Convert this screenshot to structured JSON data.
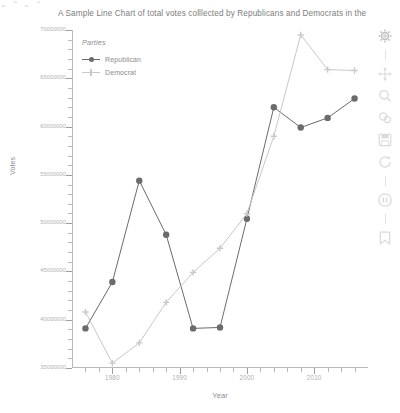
{
  "top_strip": "⌄  ⌃           ⌄  ⌃",
  "chart": {
    "title": "A Sample Line Chart of total votes colllected by Republicans and Democrats in the",
    "xlabel": "Year",
    "ylabel": "Votes",
    "legend_title": "Parties"
  },
  "legend": {
    "entries": [
      {
        "label": "Republican",
        "marker": "circle-marker",
        "color": "#6b6b6b"
      },
      {
        "label": "Democrat",
        "marker": "plus-marker",
        "color": "#c8c8c8"
      }
    ]
  },
  "toolbar": {
    "items": [
      {
        "name": "settings-gear-icon",
        "label": "Settings"
      },
      {
        "name": "move-pan-icon",
        "label": "Pan"
      },
      {
        "name": "zoom-search-icon",
        "label": "Zoom"
      },
      {
        "name": "zoom-region-icon",
        "label": "Zoom region"
      },
      {
        "name": "save-disk-icon",
        "label": "Save"
      },
      {
        "name": "refresh-reset-icon",
        "label": "Reset"
      },
      {
        "name": "info-circle-icon",
        "label": "Info"
      },
      {
        "name": "help-bookmark-icon",
        "label": "Help"
      }
    ]
  },
  "chart_data": {
    "type": "line",
    "title": "A Sample Line Chart of total votes colllected by Republicans and Democrats in the",
    "xlabel": "Year",
    "ylabel": "Votes",
    "legend_title": "Parties",
    "legend_position": "top-left inside plot",
    "grid": false,
    "xlim": [
      1974,
      2018
    ],
    "ylim": [
      35000000,
      70000000
    ],
    "xticks": [
      1980,
      1990,
      2000,
      2010
    ],
    "xtick_labels": [
      "1980",
      "1990",
      "2000",
      "2010"
    ],
    "yticks": [
      35000000,
      40000000,
      45000000,
      50000000,
      55000000,
      60000000,
      65000000,
      70000000
    ],
    "ytick_labels": [
      "35000000",
      "40000000",
      "45000000",
      "50000000",
      "55000000",
      "60000000",
      "65000000",
      "70000000"
    ],
    "x": [
      1976,
      1980,
      1984,
      1988,
      1992,
      1996,
      2000,
      2004,
      2008,
      2012,
      2016
    ],
    "series": [
      {
        "name": "Republican",
        "color": "#6b6b6b",
        "marker": "circle",
        "values": [
          39100000,
          43900000,
          54400000,
          48800000,
          39100000,
          39200000,
          50460000,
          62000000,
          59900000,
          60900000,
          62900000
        ]
      },
      {
        "name": "Democrat",
        "color": "#c8c8c8",
        "marker": "plus",
        "values": [
          40800000,
          35500000,
          37600000,
          41800000,
          44900000,
          47400000,
          50990000,
          59000000,
          69500000,
          65900000,
          65800000
        ]
      }
    ]
  }
}
